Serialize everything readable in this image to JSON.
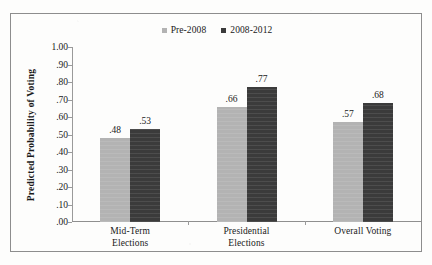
{
  "chart_data": {
    "type": "bar",
    "title": "",
    "subtitle": "",
    "xlabel": "",
    "ylabel": "Predicted Probability of Voting",
    "ylim": [
      0,
      1.0
    ],
    "ytick_labels": [
      "1.00",
      ".90",
      ".80",
      ".70",
      ".60",
      ".50",
      ".40",
      ".30",
      ".20",
      ".10",
      ".00"
    ],
    "ytick_values": [
      1.0,
      0.9,
      0.8,
      0.7,
      0.6,
      0.5,
      0.4,
      0.3,
      0.2,
      0.1,
      0.0
    ],
    "grid": false,
    "legend_position": "top-center",
    "categories": [
      "Mid-Term Elections",
      "Presidential Elections",
      "Overall Voting"
    ],
    "category_lines": [
      [
        "Mid-Term",
        "Elections"
      ],
      [
        "Presidential",
        "Elections"
      ],
      [
        "Overall Voting",
        ""
      ]
    ],
    "series": [
      {
        "name": "Pre-2008",
        "color": "#b3b3b3",
        "values": [
          0.48,
          0.66,
          0.57
        ],
        "labels": [
          ".48",
          ".66",
          ".57"
        ]
      },
      {
        "name": "2008-2012",
        "color": "#3b3b3b",
        "values": [
          0.53,
          0.77,
          0.68
        ],
        "labels": [
          ".53",
          ".77",
          ".68"
        ]
      }
    ]
  },
  "legend": {
    "entries": [
      {
        "label": "Pre-2008",
        "color": "#b3b3b3"
      },
      {
        "label": "2008-2012",
        "color": "#3b3b3b"
      }
    ]
  },
  "colors": {
    "series_light": "#b3b3b3",
    "series_dark": "#3b3b3b",
    "frame": "#8d8d8d",
    "axis": "#9a9a9a",
    "text": "#1a1a1a",
    "background": "#fdfdfc"
  }
}
